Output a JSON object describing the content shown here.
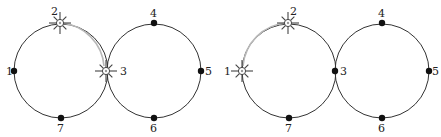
{
  "figures": [
    {
      "id": "left",
      "circles": [
        {
          "cx": 61,
          "cy": 71,
          "r": 47
        },
        {
          "cx": 154,
          "cy": 71,
          "r": 47
        }
      ],
      "nodes": [
        {
          "label": "1",
          "x": 14,
          "y": 71,
          "type": "dot",
          "lx": 6,
          "ly": 75
        },
        {
          "label": "2",
          "x": 60,
          "y": 23,
          "type": "burst",
          "lx": 51,
          "ly": 15
        },
        {
          "label": "3",
          "x": 106,
          "y": 71,
          "type": "burst",
          "lx": 120,
          "ly": 75
        },
        {
          "label": "4",
          "x": 154,
          "y": 23,
          "type": "dot",
          "lx": 150,
          "ly": 17
        },
        {
          "label": "5",
          "x": 201,
          "y": 71,
          "type": "dot",
          "lx": 205,
          "ly": 75
        },
        {
          "label": "6",
          "x": 154,
          "y": 118,
          "type": "dot",
          "lx": 150,
          "ly": 132
        },
        {
          "label": "7",
          "x": 61,
          "y": 118,
          "type": "dot",
          "lx": 57,
          "ly": 132
        }
      ],
      "path": {
        "from": "2",
        "to": "3",
        "d": "M 62 23 A 47 47 0 0 1 104 66"
      }
    },
    {
      "id": "right",
      "circles": [
        {
          "cx": 289,
          "cy": 71,
          "r": 47
        },
        {
          "cx": 382,
          "cy": 71,
          "r": 47
        }
      ],
      "nodes": [
        {
          "label": "1",
          "x": 242,
          "y": 71,
          "type": "burst",
          "lx": 224,
          "ly": 75
        },
        {
          "label": "2",
          "x": 288,
          "y": 23,
          "type": "burst",
          "lx": 290,
          "ly": 15
        },
        {
          "label": "3",
          "x": 335,
          "y": 71,
          "type": "dot",
          "lx": 340,
          "ly": 75
        },
        {
          "label": "4",
          "x": 382,
          "y": 23,
          "type": "dot",
          "lx": 378,
          "ly": 17
        },
        {
          "label": "5",
          "x": 429,
          "y": 71,
          "type": "dot",
          "lx": 432,
          "ly": 75
        },
        {
          "label": "6",
          "x": 382,
          "y": 118,
          "type": "dot",
          "lx": 378,
          "ly": 132
        },
        {
          "label": "7",
          "x": 289,
          "y": 118,
          "type": "dot",
          "lx": 285,
          "ly": 132
        }
      ],
      "path": {
        "from": "2",
        "to": "1",
        "d": "M 286 23 A 47 47 0 0 0 243 66"
      }
    }
  ],
  "colors": {
    "circle": "#333333",
    "node": "#111111",
    "path": "#b8b8b8",
    "burst": "#444444"
  }
}
